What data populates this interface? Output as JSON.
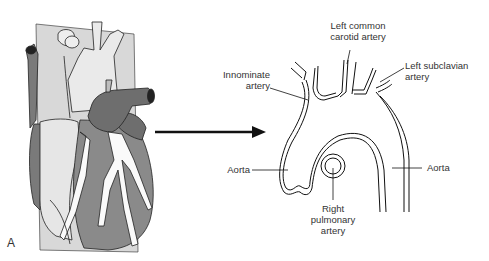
{
  "figure": {
    "panel_letter": "A",
    "left_illustration": "Anterior view of heart with coronal section plane through great vessels",
    "right_illustration": "Coronal section of aortic arch"
  },
  "labels": {
    "left_common_carotid_line1": "Left common",
    "left_common_carotid_line2": "carotid artery",
    "innominate_line1": "Innominate",
    "innominate_line2": "artery",
    "left_subclavian_line1": "Left subclavian",
    "left_subclavian_line2": "artery",
    "aorta_left": "Aorta",
    "aorta_right": "Aorta",
    "right_pulmonary_line1": "Right",
    "right_pulmonary_line2": "pulmonary",
    "right_pulmonary_line3": "artery"
  },
  "colors": {
    "heart_dark": "#6e6e6e",
    "heart_mid": "#8a8a8a",
    "plane": "#d6d6d6",
    "vessel_light": "#f2f2f2",
    "line": "#222222"
  }
}
